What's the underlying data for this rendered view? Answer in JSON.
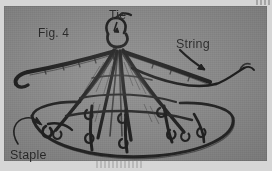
{
  "figure": {
    "plate_background_color": "#8d8d8d",
    "paper_background_color": "#d6d6d6",
    "ink_color": "#272727",
    "figure_number_label": "Fig. 4",
    "labels": {
      "tie": "Tie",
      "string": "String",
      "staple": "Staple"
    },
    "callouts": [
      {
        "name": "tie",
        "label": "Tie",
        "points_to": "apex-tie-knot"
      },
      {
        "name": "string",
        "label": "String",
        "points_to": "string-cord"
      },
      {
        "name": "staple",
        "label": "Staple",
        "points_to": "base-staple"
      }
    ]
  }
}
